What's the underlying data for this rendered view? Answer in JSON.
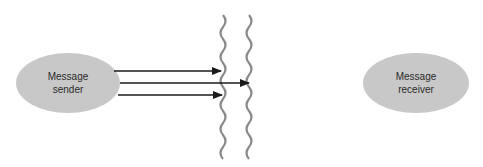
{
  "diagram": {
    "sender": {
      "line1": "Message",
      "line2": "sender"
    },
    "receiver": {
      "line1": "Message",
      "line2": "receiver"
    },
    "colors": {
      "ellipse_fill": "#c8c8c8",
      "arrow": "#1a1a1a",
      "barrier": "#8a8a8a"
    },
    "arrows": [
      {
        "from_x": 114,
        "to_x": 221,
        "y": 71
      },
      {
        "from_x": 120,
        "to_x": 249,
        "y": 83
      },
      {
        "from_x": 118,
        "to_x": 222,
        "y": 95
      }
    ],
    "barriers": [
      {
        "x": 225
      },
      {
        "x": 251
      }
    ]
  }
}
